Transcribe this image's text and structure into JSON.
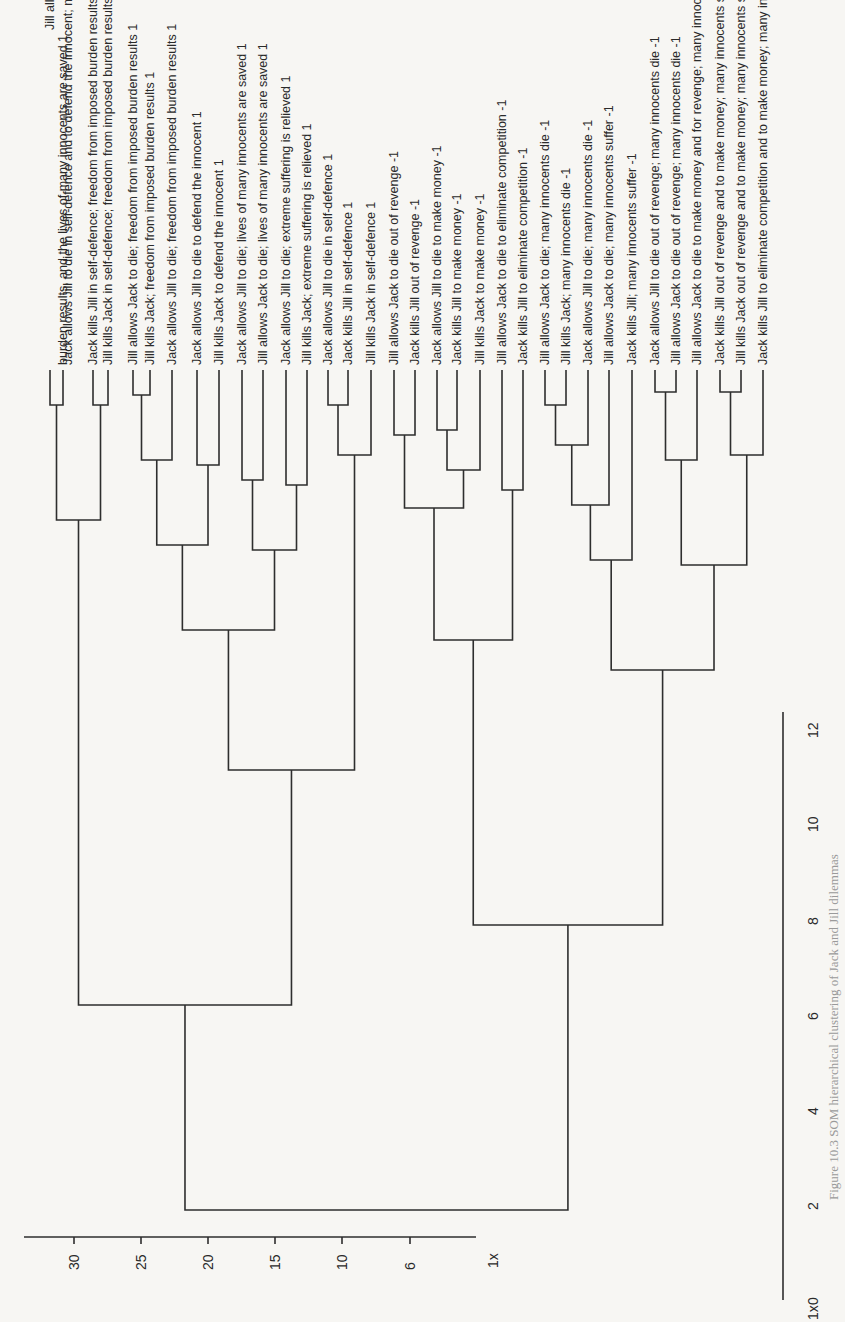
{
  "chart_data": {
    "type": "dendrogram",
    "orientation": "image rotated 90 degrees; leaves at top, root at bottom",
    "left_axis": {
      "label": "1x",
      "ticks": [
        "30",
        "25",
        "20",
        "15",
        "10",
        "6"
      ],
      "ticks_px_x": [
        74,
        141,
        208,
        275,
        342,
        410
      ]
    },
    "right_axis": {
      "label": "1x",
      "ticks": [
        "0",
        "2",
        "4",
        "6",
        "8",
        "10",
        "12"
      ],
      "ticks_px_y": [
        1300,
        1205,
        1110,
        1015,
        920,
        827,
        733
      ]
    },
    "leaves": [
      {
        "x": 50,
        "top": 30,
        "label": "Jill allows Jack to die to defend the innocent; extreme suffering is relieved, freedom from imposed"
      },
      {
        "x": 63,
        "top": 365,
        "label": "burden results, and the lives of many innocents are saved 1"
      },
      {
        "x": 68,
        "top": 365,
        "label": "Jack allows Jill to die in self-defence and to defend the innocent; many innocents are saved 1"
      },
      {
        "x": 93,
        "top": 365,
        "label": "Jack kills Jill in self-defence; freedom from imposed burden results 1"
      },
      {
        "x": 108,
        "top": 365,
        "label": "Jill kills Jack in self-defence; freedom from imposed burden results 1"
      },
      {
        "x": 133,
        "top": 365,
        "label": "Jill allows Jack to die; freedom from imposed burden results 1"
      },
      {
        "x": 150,
        "top": 365,
        "label": "Jill kills Jack; freedom from imposed burden results 1"
      },
      {
        "x": 172,
        "top": 365,
        "label": "Jack allows Jill to die; freedom from imposed burden results 1"
      },
      {
        "x": 197,
        "top": 365,
        "label": "Jack allows Jill to die to defend the innocent 1"
      },
      {
        "x": 219,
        "top": 365,
        "label": "Jill kills Jack to defend the innocent 1"
      },
      {
        "x": 242,
        "top": 365,
        "label": "Jack allows Jill to die; lives of many innocents are saved 1"
      },
      {
        "x": 263,
        "top": 365,
        "label": "Jill allows Jack to die; lives of many innocents are saved 1"
      },
      {
        "x": 286,
        "top": 365,
        "label": "Jack allows Jill to die; extreme suffering is relieved 1"
      },
      {
        "x": 307,
        "top": 365,
        "label": "Jill kills Jack; extreme suffering is relieved 1"
      },
      {
        "x": 328,
        "top": 365,
        "label": "Jack allows Jill to die in self-defence 1"
      },
      {
        "x": 348,
        "top": 365,
        "label": "Jack kills Jill in self-defence 1"
      },
      {
        "x": 371,
        "top": 365,
        "label": "Jill kills Jack in self-defence 1"
      },
      {
        "x": 394,
        "top": 365,
        "label": "Jill allows Jack to die out of revenge -1"
      },
      {
        "x": 415,
        "top": 365,
        "label": "Jack kills Jill out of revenge -1"
      },
      {
        "x": 437,
        "top": 365,
        "label": "Jack allows Jill to die to make money -1"
      },
      {
        "x": 457,
        "top": 365,
        "label": "Jack kills Jill to make money -1"
      },
      {
        "x": 480,
        "top": 365,
        "label": "Jill kills Jack to make money -1"
      },
      {
        "x": 502,
        "top": 365,
        "label": "Jill allows Jack to die to eliminate competition -1"
      },
      {
        "x": 523,
        "top": 365,
        "label": "Jack kills Jill to eliminate competition -1"
      },
      {
        "x": 545,
        "top": 365,
        "label": "Jill allows Jack to die; many innocents die -1"
      },
      {
        "x": 566,
        "top": 365,
        "label": "Jill kills Jack; many innocents die -1"
      },
      {
        "x": 588,
        "top": 365,
        "label": "Jack allows Jill to die; many innocents die -1"
      },
      {
        "x": 609,
        "top": 365,
        "label": "Jill allows Jack to die; many innocents suffer -1"
      },
      {
        "x": 632,
        "top": 365,
        "label": "Jack kills Jill; many innocents suffer -1"
      },
      {
        "x": 655,
        "top": 365,
        "label": "Jack allows Jill to die out of revenge; many innocents die -1"
      },
      {
        "x": 676,
        "top": 365,
        "label": "Jill allows Jack to die out of revenge; many innocents die -1"
      },
      {
        "x": 697,
        "top": 365,
        "label": "Jill allows Jack to die to make money and for revenge; many innocents die -1"
      },
      {
        "x": 720,
        "top": 365,
        "label": "Jack kills Jill out of revenge and to make money; many innocents suffer -1"
      },
      {
        "x": 741,
        "top": 365,
        "label": "Jill kills Jack out of revenge and to make money; many innocents suffer -1"
      },
      {
        "x": 763,
        "top": 365,
        "label": "Jack kills Jill to eliminate competition and to make money; many innocents suffer -1"
      }
    ],
    "title": "",
    "xlabel": "",
    "ylabel": ""
  },
  "caption": "Figure 10.3 SOM hierarchical clustering of Jack and Jill dilemmas"
}
